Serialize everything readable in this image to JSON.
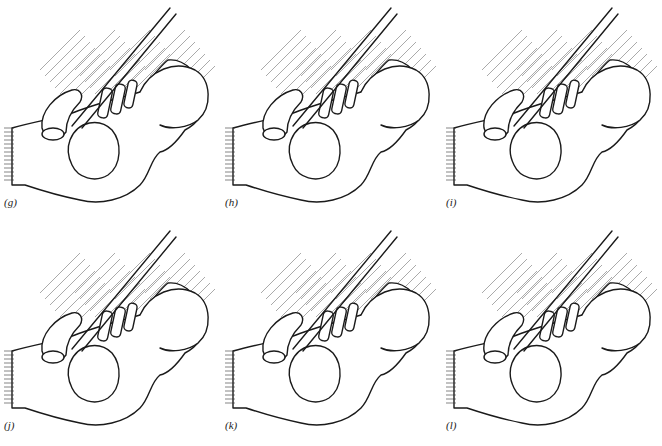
{
  "figure": {
    "panels": [
      {
        "id": "g",
        "label": "(g)"
      },
      {
        "id": "h",
        "label": "(h)"
      },
      {
        "id": "i",
        "label": "(i)"
      },
      {
        "id": "j",
        "label": "(j)"
      },
      {
        "id": "k",
        "label": "(k)"
      },
      {
        "id": "l",
        "label": "(l)"
      }
    ]
  }
}
